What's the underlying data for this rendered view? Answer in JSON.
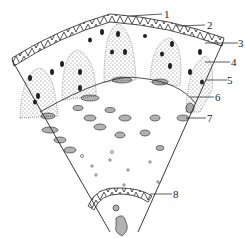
{
  "diagram": {
    "type": "biological cross-section (wedge sector)",
    "labels": [
      {
        "id": "1",
        "text": "1"
      },
      {
        "id": "2",
        "text": "2"
      },
      {
        "id": "3",
        "text": "3"
      },
      {
        "id": "4",
        "text": "4"
      },
      {
        "id": "5",
        "text": "5"
      },
      {
        "id": "6",
        "text": "6"
      },
      {
        "id": "7",
        "text": "7"
      },
      {
        "id": "8",
        "text": "8"
      }
    ],
    "colors": {
      "ink": "#222222",
      "background": "#ffffff"
    }
  }
}
